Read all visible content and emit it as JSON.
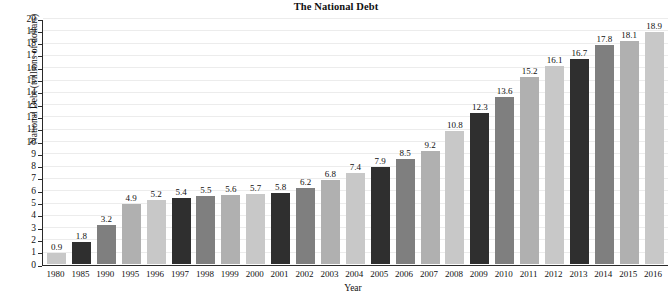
{
  "chart_data": {
    "type": "bar",
    "title": "The National Debt",
    "xlabel": "Year",
    "ylabel": "National Debt (trillions of dollars)",
    "ylim": [
      0,
      20
    ],
    "ytick_step": 1,
    "grid": true,
    "legend": "none",
    "categories": [
      "1980",
      "1985",
      "1990",
      "1995",
      "1996",
      "1997",
      "1998",
      "1999",
      "2000",
      "2001",
      "2002",
      "2003",
      "2004",
      "2005",
      "2006",
      "2007",
      "2008",
      "2009",
      "2010",
      "2011",
      "2012",
      "2013",
      "2014",
      "2015",
      "2016"
    ],
    "values": [
      0.9,
      1.8,
      3.2,
      4.9,
      5.2,
      5.4,
      5.5,
      5.6,
      5.7,
      5.8,
      6.2,
      6.8,
      7.4,
      7.9,
      8.5,
      9.2,
      10.8,
      12.3,
      13.6,
      15.2,
      16.1,
      16.7,
      17.8,
      18.1,
      18.9
    ],
    "value_labels": [
      "0.9",
      "1.8",
      "3.2",
      "4.9",
      "5.2",
      "5.4",
      "5.5",
      "5.6",
      "5.7",
      "5.8",
      "6.2",
      "6.8",
      "7.4",
      "7.9",
      "8.5",
      "9.2",
      "10.8",
      "12.3",
      "13.6",
      "15.2",
      "16.1",
      "16.7",
      "17.8",
      "18.1",
      "18.9"
    ],
    "ytick_labels": [
      "0",
      "1",
      "2",
      "3",
      "4",
      "5",
      "6",
      "7",
      "8",
      "9",
      "10",
      "11",
      "12",
      "13",
      "14",
      "15",
      "16",
      "17",
      "18",
      "19",
      "20"
    ],
    "bar_colors": [
      "#c8c8c8",
      "#2f2f2f",
      "#7f7f7f",
      "#b0b0b0"
    ],
    "bar_color_cycle_length": 4,
    "colors": {
      "background": "#ffffff",
      "axis": "#2a2a2a",
      "gridline": "#ececec",
      "text": "#111111"
    }
  }
}
